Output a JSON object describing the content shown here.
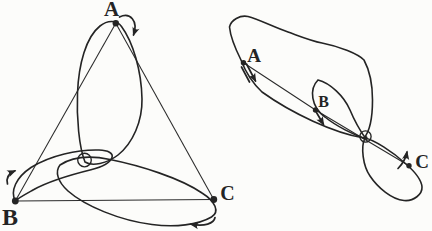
{
  "canvas": {
    "width": 432,
    "height": 231,
    "background_color": "#fcfcfa",
    "ink_color": "#242424"
  },
  "left_diagram": {
    "description": "triangular three-body configuration with three orbital loops meeting at a central circle",
    "labels": {
      "a": "A",
      "b": "B",
      "c": "C"
    }
  },
  "right_diagram": {
    "description": "collinear three-body configuration with three elliptical orbits sharing a common focus",
    "labels": {
      "a": "A",
      "b": "B",
      "c": "C"
    }
  }
}
